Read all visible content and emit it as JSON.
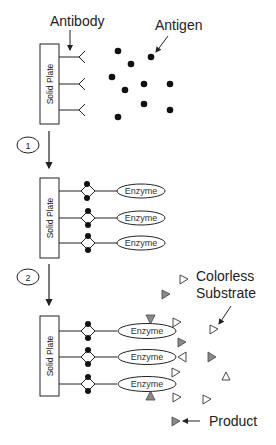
{
  "labels": {
    "antibody": "Antibody",
    "antigen": "Antigen",
    "solid_plate": "Solid Plate",
    "enzyme": "Enzyme",
    "colorless_substrate_line1": "Colorless",
    "colorless_substrate_line2": "Substrate",
    "product": "Product"
  },
  "steps": [
    {
      "number": "1"
    },
    {
      "number": "2"
    }
  ],
  "colors": {
    "line": "#222222",
    "product_fill": "#8a8a8a",
    "substrate_fill": "#ffffff"
  },
  "stages": [
    {
      "name": "antibody-coated plate with free antigens",
      "antibody_count": 3,
      "antigen_count": 10
    },
    {
      "name": "antibody-antigen-enzyme complex",
      "enzyme_count": 3
    },
    {
      "name": "enzyme converts colorless substrate to product",
      "enzyme_count": 3
    }
  ]
}
